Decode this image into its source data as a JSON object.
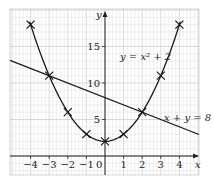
{
  "chart_data": {
    "type": "line",
    "title": "",
    "xlabel": "x",
    "ylabel": "y",
    "xlim": [
      -4.5,
      4.5
    ],
    "ylim": [
      -1.5,
      19.5
    ],
    "grid": true,
    "x_ticks": [
      -4,
      -3,
      -2,
      -1,
      1,
      2,
      3,
      4
    ],
    "x_tick_labels": [
      "−4",
      "−3",
      "−2",
      "−1",
      "1",
      "2",
      "3",
      "4"
    ],
    "y_ticks": [
      5,
      10,
      15
    ],
    "y_tick_labels": [
      "5",
      "10",
      "15"
    ],
    "origin_label": "0",
    "series": [
      {
        "name": "y = x² + 2",
        "kind": "curve",
        "x": [
          -4,
          -3,
          -2,
          -1,
          0,
          1,
          2,
          3,
          4
        ],
        "y": [
          18,
          11,
          6,
          3,
          2,
          3,
          6,
          11,
          18
        ],
        "markers": "cross"
      },
      {
        "name": "x + y = 8",
        "kind": "line",
        "x": [
          -5,
          5
        ],
        "y": [
          13,
          3
        ]
      }
    ],
    "annotations": [
      {
        "text": "y = x² + 2",
        "near": [
          2.6,
          13.5
        ]
      },
      {
        "text": "x + y = 8",
        "near": [
          4.2,
          5.8
        ]
      }
    ]
  },
  "labels": {
    "x_axis": "x",
    "y_axis": "y",
    "origin": "0",
    "curve": "y = x² + 2",
    "line": "x + y = 8"
  }
}
